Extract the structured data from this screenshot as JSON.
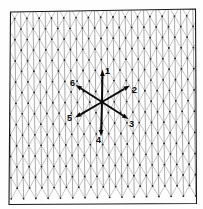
{
  "figure": {
    "type": "triangular-lattice-vector-diagram",
    "background_color": "#fefefe",
    "frame": {
      "stroke_color": "#1a1a1a",
      "stroke_width": 1.1,
      "corners": [
        {
          "x": 10.5,
          "y": 12.0
        },
        {
          "x": 195.5,
          "y": 9.0
        },
        {
          "x": 196.5,
          "y": 203.5
        },
        {
          "x": 9.0,
          "y": 204.5
        }
      ]
    },
    "lattice": {
      "description": "triangular (hexagonal) lattice of dots connected by three line families",
      "node_color": "#202020",
      "node_radius": 0.9,
      "line_color": "#9a9a9a",
      "line_width": 0.6,
      "column_spacing": 12.3,
      "row_spacing": 10.6,
      "columns": 16,
      "rows": 19,
      "rotation_deg": -0.9
    },
    "center": {
      "x": 102.0,
      "y": 102.0
    },
    "vectors": [
      {
        "label": "1",
        "angle_deg": 90,
        "length": 33,
        "tip": {
          "x": 102.5,
          "y": 69.5
        },
        "label_pos": {
          "x": 105,
          "y": 67
        },
        "shaft_width": 2.0
      },
      {
        "label": "2",
        "angle_deg": 33,
        "length": 33,
        "tip": {
          "x": 130.0,
          "y": 85.5
        },
        "label_pos": {
          "x": 132,
          "y": 86
        },
        "shaft_width": 2.0
      },
      {
        "label": "3",
        "angle_deg": -31,
        "length": 31,
        "tip": {
          "x": 128.5,
          "y": 119.0
        },
        "label_pos": {
          "x": 129,
          "y": 120
        },
        "shaft_width": 2.0
      },
      {
        "label": "4",
        "angle_deg": -90,
        "length": 34,
        "tip": {
          "x": 101.0,
          "y": 136.5
        },
        "label_pos": {
          "x": 96,
          "y": 136
        },
        "shaft_width": 2.0
      },
      {
        "label": "5",
        "angle_deg": 208,
        "length": 31,
        "tip": {
          "x": 75.0,
          "y": 117.5
        },
        "label_pos": {
          "x": 67,
          "y": 114
        },
        "shaft_width": 2.0
      },
      {
        "label": "6",
        "angle_deg": 148,
        "length": 31,
        "tip": {
          "x": 75.5,
          "y": 85.0
        },
        "label_pos": {
          "x": 70,
          "y": 79
        },
        "shaft_width": 2.0
      }
    ],
    "vector_style": {
      "color": "#0a0a0a",
      "arrowhead_length": 6.5,
      "arrowhead_width": 4.6
    }
  }
}
